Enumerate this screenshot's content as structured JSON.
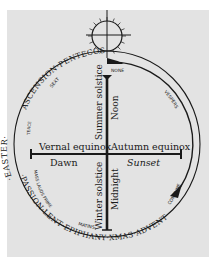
{
  "diagram": {
    "type": "liturgical-year-and-day-clock",
    "center_axis": {
      "left_end_top": "Vernal equinox",
      "left_end_bottom": "Dawn",
      "right_end_top": "Autumn equinox",
      "right_end_bottom": "Sunset",
      "top_left": "Summer solstice",
      "top_right": "Noon",
      "bottom_left": "Winter solstice",
      "bottom_right": "Midnight"
    },
    "outer_ring_feasts": {
      "top_left_arc": "ASCENSION·PENTECOST",
      "left_arc": "·EASTER·",
      "lower_left_arc": "·PASSION·LENT·EPIPHANY·XMAS·ADVENT"
    },
    "canonical_hours": {
      "none": "NONE",
      "sext": "SEXT",
      "terce": "TERCE",
      "mass_lauds_prime": "MASS LAUDS PRIME",
      "matins": "MATINS",
      "vespers": "VESPERS",
      "compline": "COMPLINE"
    },
    "symbols": {
      "sun": "sun-icon",
      "arrow": "arrow-icon"
    },
    "colors": {
      "background": "#e3e3e3",
      "ink": "#1a1a1a"
    }
  }
}
